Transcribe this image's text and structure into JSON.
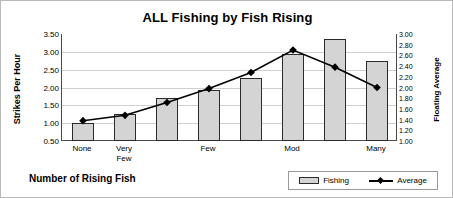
{
  "chart_data": {
    "type": "bar",
    "title": "ALL Fishing by Fish Rising",
    "xlabel": "Number of Rising Fish",
    "ylabel": "Strikes Per Hour",
    "ylabel_right": "Floating Average",
    "categories": [
      "None",
      "Very\nFew",
      "",
      "Few",
      "",
      "Mod",
      "",
      "Many"
    ],
    "grid": true,
    "legend_position": "bottom-right",
    "ylim": [
      0.5,
      3.5
    ],
    "yticks": [
      "0.50",
      "1.00",
      "1.50",
      "2.00",
      "2.50",
      "3.00",
      "3.50"
    ],
    "ylim_right": [
      1.0,
      3.0
    ],
    "yticks_right": [
      "1.00",
      "1.20",
      "1.40",
      "1.60",
      "1.80",
      "2.00",
      "2.20",
      "2.40",
      "2.60",
      "2.80",
      "3.00"
    ],
    "series": [
      {
        "name": "Fishing",
        "type": "bar",
        "axis": "left",
        "color": "#d4d4d4",
        "values": [
          1.0,
          1.25,
          1.7,
          1.92,
          2.27,
          2.95,
          3.35,
          2.75
        ]
      },
      {
        "name": "Average",
        "type": "line",
        "axis": "right",
        "color": "#000000",
        "values": [
          1.38,
          1.48,
          1.72,
          1.98,
          2.28,
          2.7,
          2.38,
          2.0
        ]
      }
    ]
  },
  "legend": {
    "items": [
      {
        "label": "Fishing"
      },
      {
        "label": "Average"
      }
    ]
  }
}
